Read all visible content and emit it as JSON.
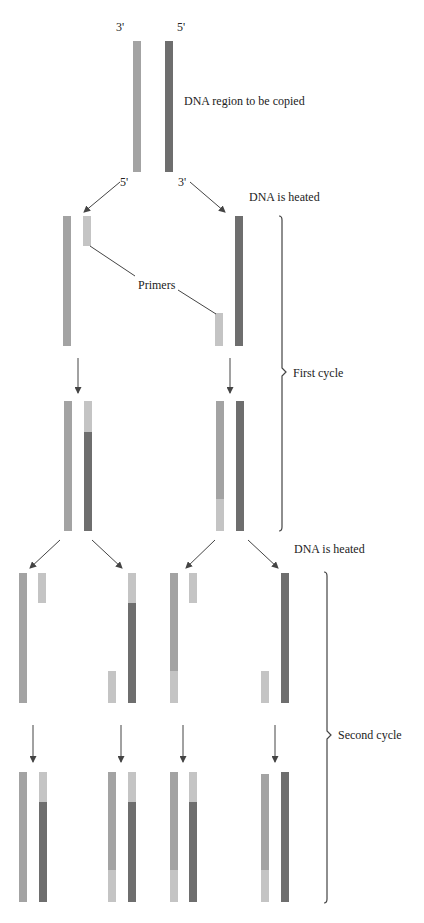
{
  "colors": {
    "template_strand": "#a3a3a3",
    "complement_strand": "#6e6e6e",
    "primer": "#c4c4c4",
    "arrow": "#444444",
    "bracket": "#444444"
  },
  "labels": {
    "top_left_end_top": "3'",
    "top_right_end_top": "5'",
    "region": "DNA region to be copied",
    "top_left_end_bottom": "5'",
    "top_right_end_bottom": "3'",
    "heated_1": "DNA is heated",
    "primers": "Primers",
    "first_cycle": "First cycle",
    "heated_2": "DNA is heated",
    "second_cycle": "Second cycle"
  },
  "stages": [
    {
      "name": "original-duplex",
      "strands": [
        {
          "x": 133,
          "y": 41,
          "h": 131,
          "segments": [
            {
              "color": "template_strand",
              "h": 131
            }
          ]
        },
        {
          "x": 165,
          "y": 41,
          "h": 131,
          "segments": [
            {
              "color": "complement_strand",
              "h": 131
            }
          ]
        }
      ]
    },
    {
      "name": "first-cycle-separated",
      "strands": [
        {
          "x": 63,
          "y": 216,
          "segments": [
            {
              "color": "template_strand",
              "h": 130
            }
          ]
        },
        {
          "x": 83,
          "y": 216,
          "segments": [
            {
              "color": "primer",
              "h": 30
            }
          ]
        },
        {
          "x": 215,
          "y": 313,
          "segments": [
            {
              "color": "primer",
              "h": 33
            }
          ]
        },
        {
          "x": 235,
          "y": 216,
          "segments": [
            {
              "color": "complement_strand",
              "h": 130
            }
          ]
        }
      ]
    },
    {
      "name": "first-cycle-extended",
      "strands": [
        {
          "x": 64,
          "y": 401,
          "segments": [
            {
              "color": "template_strand",
              "h": 130
            }
          ]
        },
        {
          "x": 84,
          "y": 401,
          "segments": [
            {
              "color": "primer",
              "h": 31
            },
            {
              "color": "complement_strand",
              "h": 99
            }
          ]
        },
        {
          "x": 216,
          "y": 401,
          "segments": [
            {
              "color": "template_strand",
              "h": 98
            },
            {
              "color": "primer",
              "h": 32
            }
          ]
        },
        {
          "x": 236,
          "y": 401,
          "segments": [
            {
              "color": "complement_strand",
              "h": 130
            }
          ]
        }
      ]
    },
    {
      "name": "second-cycle-separated",
      "strands": [
        {
          "x": 19,
          "y": 573,
          "segments": [
            {
              "color": "template_strand",
              "h": 130
            }
          ]
        },
        {
          "x": 38,
          "y": 573,
          "segments": [
            {
              "color": "primer",
              "h": 30
            }
          ]
        },
        {
          "x": 108,
          "y": 671,
          "segments": [
            {
              "color": "primer",
              "h": 32
            }
          ]
        },
        {
          "x": 128,
          "y": 573,
          "segments": [
            {
              "color": "primer",
              "h": 30
            },
            {
              "color": "complement_strand",
              "h": 100
            }
          ]
        },
        {
          "x": 170,
          "y": 573,
          "segments": [
            {
              "color": "template_strand",
              "h": 98
            },
            {
              "color": "primer",
              "h": 32
            }
          ]
        },
        {
          "x": 189,
          "y": 573,
          "segments": [
            {
              "color": "primer",
              "h": 30
            }
          ]
        },
        {
          "x": 261,
          "y": 671,
          "segments": [
            {
              "color": "primer",
              "h": 32
            }
          ]
        },
        {
          "x": 281,
          "y": 573,
          "segments": [
            {
              "color": "complement_strand",
              "h": 130
            }
          ]
        }
      ]
    },
    {
      "name": "second-cycle-extended",
      "strands": [
        {
          "x": 19,
          "y": 772,
          "segments": [
            {
              "color": "template_strand",
              "h": 130
            }
          ]
        },
        {
          "x": 39,
          "y": 772,
          "segments": [
            {
              "color": "primer",
              "h": 30
            },
            {
              "color": "complement_strand",
              "h": 100
            }
          ]
        },
        {
          "x": 108,
          "y": 772,
          "segments": [
            {
              "color": "template_strand",
              "h": 98
            },
            {
              "color": "primer",
              "h": 32
            }
          ]
        },
        {
          "x": 128,
          "y": 772,
          "segments": [
            {
              "color": "primer",
              "h": 30
            },
            {
              "color": "complement_strand",
              "h": 100
            }
          ]
        },
        {
          "x": 170,
          "y": 772,
          "segments": [
            {
              "color": "template_strand",
              "h": 98
            },
            {
              "color": "primer",
              "h": 32
            }
          ]
        },
        {
          "x": 189,
          "y": 772,
          "segments": [
            {
              "color": "primer",
              "h": 30
            },
            {
              "color": "complement_strand",
              "h": 100
            }
          ]
        },
        {
          "x": 261,
          "y": 774,
          "segments": [
            {
              "color": "template_strand",
              "h": 96
            },
            {
              "color": "primer",
              "h": 32
            }
          ]
        },
        {
          "x": 281,
          "y": 772,
          "segments": [
            {
              "color": "complement_strand",
              "h": 130
            }
          ]
        }
      ]
    }
  ],
  "arrows": [
    {
      "x1": 120,
      "y1": 182,
      "x2": 84,
      "y2": 212
    },
    {
      "x1": 190,
      "y1": 182,
      "x2": 225,
      "y2": 212
    },
    {
      "x1": 78,
      "y1": 358,
      "x2": 78,
      "y2": 393
    },
    {
      "x1": 230,
      "y1": 358,
      "x2": 230,
      "y2": 393
    },
    {
      "x1": 60,
      "y1": 540,
      "x2": 30,
      "y2": 568
    },
    {
      "x1": 92,
      "y1": 540,
      "x2": 122,
      "y2": 568
    },
    {
      "x1": 215,
      "y1": 540,
      "x2": 186,
      "y2": 568
    },
    {
      "x1": 248,
      "y1": 540,
      "x2": 278,
      "y2": 568
    },
    {
      "x1": 33,
      "y1": 725,
      "x2": 33,
      "y2": 762
    },
    {
      "x1": 121,
      "y1": 725,
      "x2": 121,
      "y2": 762
    },
    {
      "x1": 183,
      "y1": 725,
      "x2": 183,
      "y2": 762
    },
    {
      "x1": 275,
      "y1": 725,
      "x2": 275,
      "y2": 762
    }
  ],
  "primer_leaders": [
    {
      "x1": 90,
      "y1": 246,
      "x2": 135,
      "y2": 276
    },
    {
      "x1": 178,
      "y1": 290,
      "x2": 216,
      "y2": 314
    }
  ],
  "brackets": [
    {
      "name": "first-cycle-bracket",
      "x": 282,
      "y1": 216,
      "y2": 531,
      "mid": 372
    },
    {
      "name": "second-cycle-bracket",
      "x": 327,
      "y1": 572,
      "y2": 903,
      "mid": 735
    }
  ]
}
